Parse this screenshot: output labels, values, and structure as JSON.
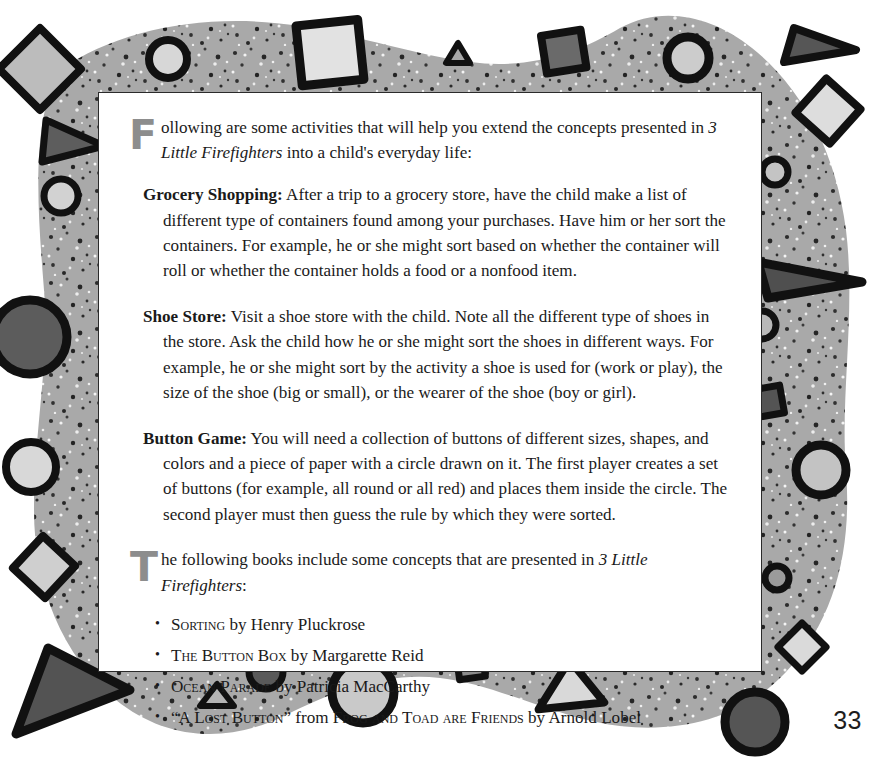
{
  "page": {
    "number": "33",
    "background_color": "#ffffff",
    "panel_color": "#ffffff",
    "border_band_color": "#a8a8a8",
    "ink_color": "#1a1a1a",
    "dropcap_color": "#8d8d8d"
  },
  "intro": {
    "dropcap": "F",
    "text_before_title": "ollowing are some activities that will help you extend the concepts presented in ",
    "title": "3 Little Firefighters",
    "text_after_title": " into a child's everyday life:"
  },
  "activities": [
    {
      "lead": "Grocery Shopping:",
      "body": " After a trip to a grocery store, have the child make a list of different type of containers found among your purchases. Have him or her sort the containers. For example, he or she might sort based on whether the container will roll or whether the container holds a food or a nonfood item."
    },
    {
      "lead": "Shoe Store:",
      "body": " Visit a shoe store with the child.  Note all the different type of shoes in the store. Ask the child how he or she might sort the shoes in different ways. For example, he or she might sort by the activity a shoe is used for (work or play), the size of the shoe (big or small), or the wearer of the shoe (boy or girl)."
    },
    {
      "lead": "Button Game:",
      "body": " You will need a collection of buttons of different sizes, shapes, and colors and a piece of paper with a circle drawn on it. The first player creates a set of buttons (for example, all round or all red) and places them inside the circle. The second player must then guess the rule by which they were sorted."
    }
  ],
  "books_intro": {
    "dropcap": "T",
    "text_before_title": "he following books include some concepts that are presented in ",
    "title": "3 Little Firefighters",
    "text_after_title": ":"
  },
  "books": [
    {
      "bullet": "•",
      "title": "Sorting",
      "byline": " by Henry Pluckrose",
      "extra_title": "",
      "extra_byline": ""
    },
    {
      "bullet": "•",
      "title": "The Button Box",
      "byline": " by Margarette Reid",
      "extra_title": "",
      "extra_byline": ""
    },
    {
      "bullet": "•",
      "title": "Ocean Parade",
      "byline": " by Patricia MacCarthy",
      "extra_title": "",
      "extra_byline": ""
    },
    {
      "bullet": "•",
      "title": "“A Lost Button”",
      "byline": " from ",
      "extra_title": "Frog and Toad are Friends",
      "extra_byline": " by Arnold Lobel"
    }
  ],
  "border_shapes": [
    {
      "name": "diamond",
      "fill": "#b9b9b9"
    },
    {
      "name": "square",
      "fill": "#e0e0e0"
    },
    {
      "name": "square-dark",
      "fill": "#6f6f6f"
    },
    {
      "name": "circle-light",
      "fill": "#cfcfcf"
    },
    {
      "name": "circle-dark",
      "fill": "#5f5f5f"
    },
    {
      "name": "triangle",
      "fill": "#8f8f8f"
    },
    {
      "name": "triangle-dark",
      "fill": "#5a5a5a"
    }
  ]
}
